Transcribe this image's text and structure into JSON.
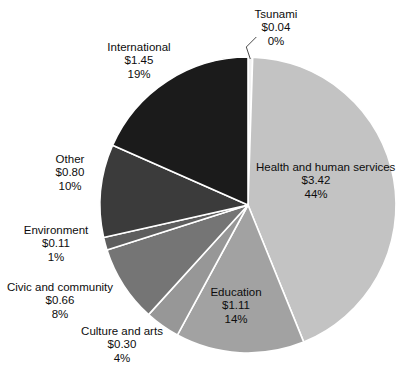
{
  "chart_data": {
    "type": "pie",
    "title": "",
    "subtitle": "",
    "xlabel": "",
    "ylabel": "",
    "legend": "none",
    "grid": false,
    "value_prefix": "$",
    "total": 7.89,
    "start_angle_deg": -90,
    "direction": "clockwise",
    "categories": [
      "Tsunami",
      "Health and human services",
      "Education",
      "Culture and arts",
      "Civic and community",
      "Environment",
      "Other",
      "International"
    ],
    "values": [
      0.04,
      3.42,
      1.11,
      0.3,
      0.66,
      0.11,
      0.8,
      1.45
    ],
    "percents": [
      0,
      44,
      14,
      4,
      8,
      1,
      10,
      19
    ],
    "colors": [
      "#f2f2f2",
      "#c3c3c3",
      "#a2a2a2",
      "#979797",
      "#757575",
      "#5e5e5e",
      "#3b3b3b",
      "#1b1b1b"
    ],
    "slices": [
      {
        "name": "Tsunami",
        "value_label": "$0.04",
        "percent_label": "0%",
        "value": 0.04,
        "percent": 0,
        "color": "#f2f2f2",
        "label_position": "outside",
        "leader_line": true
      },
      {
        "name": "Health and human services",
        "value_label": "$3.42",
        "percent_label": "44%",
        "value": 3.42,
        "percent": 44,
        "color": "#c3c3c3",
        "label_position": "inside",
        "leader_line": false
      },
      {
        "name": "Education",
        "value_label": "$1.11",
        "percent_label": "14%",
        "value": 1.11,
        "percent": 14,
        "color": "#a2a2a2",
        "label_position": "inside",
        "leader_line": false
      },
      {
        "name": "Culture and arts",
        "value_label": "$0.30",
        "percent_label": "4%",
        "value": 0.3,
        "percent": 4,
        "color": "#979797",
        "label_position": "outside",
        "leader_line": false
      },
      {
        "name": "Civic and community",
        "value_label": "$0.66",
        "percent_label": "8%",
        "value": 0.66,
        "percent": 8,
        "color": "#757575",
        "label_position": "outside",
        "leader_line": false
      },
      {
        "name": "Environment",
        "value_label": "$0.11",
        "percent_label": "1%",
        "value": 0.11,
        "percent": 1,
        "color": "#5e5e5e",
        "label_position": "outside",
        "leader_line": false
      },
      {
        "name": "Other",
        "value_label": "$0.80",
        "percent_label": "10%",
        "value": 0.8,
        "percent": 10,
        "color": "#3b3b3b",
        "label_position": "outside",
        "leader_line": false
      },
      {
        "name": "International",
        "value_label": "$1.45",
        "percent_label": "19%",
        "value": 1.45,
        "percent": 19,
        "color": "#1b1b1b",
        "label_position": "outside",
        "leader_line": false
      }
    ],
    "geometry": {
      "center_x": 248,
      "center_y": 205,
      "radius": 148,
      "separator_color": "#ffffff",
      "separator_width": 1.6,
      "background": "#ffffff"
    }
  }
}
